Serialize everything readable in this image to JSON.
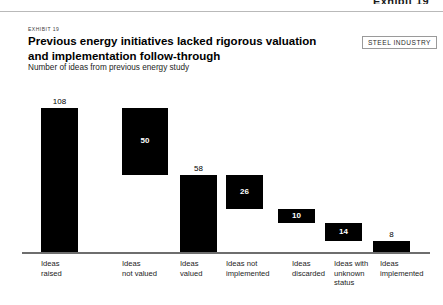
{
  "page_header": "Exhibit 19",
  "exhibit_label": "EXHIBIT 19",
  "title": "Previous energy initiatives lacked rigorous valuation and implementation follow-through",
  "subtitle": "Number of ideas from previous energy study",
  "industry_tag": "STEEL INDUSTRY",
  "colors": {
    "bar": "#000000",
    "axis": "#6e6e6e",
    "text": "#000000",
    "inner_label": "#ffffff"
  },
  "chart_data": {
    "type": "bar",
    "subtype": "waterfall",
    "title": "Previous energy initiatives lacked rigorous valuation and implementation follow-through",
    "xlabel": "",
    "ylabel": "Number of ideas from previous energy study",
    "ylim": [
      0,
      108
    ],
    "grid": false,
    "legend": null,
    "categories": [
      "Ideas raised",
      "Ideas not valued",
      "Ideas valued",
      "Ideas not implemented",
      "Ideas discarded",
      "Ideas with unknown status",
      "Ideas implemented"
    ],
    "category_lines": [
      [
        "Ideas",
        "raised"
      ],
      [
        "Ideas",
        "not valued"
      ],
      [
        "Ideas",
        "valued"
      ],
      [
        "Ideas not",
        "implemented"
      ],
      [
        "Ideas",
        "discarded"
      ],
      [
        "Ideas with",
        "unknown",
        "status"
      ],
      [
        "Ideas",
        "implemented"
      ]
    ],
    "values": [
      108,
      50,
      58,
      26,
      10,
      14,
      8
    ],
    "value_labels": [
      "108",
      "50",
      "58",
      "26",
      "10",
      "14",
      "8"
    ],
    "label_placement": [
      "above",
      "inside",
      "above",
      "inside",
      "inside",
      "inside",
      "above"
    ],
    "bases": [
      0,
      58,
      0,
      32,
      22,
      8,
      0
    ]
  }
}
